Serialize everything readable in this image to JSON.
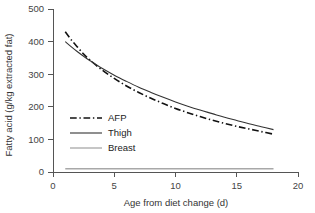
{
  "chart_data": {
    "type": "line",
    "title": "",
    "xlabel": "Age from diet change (d)",
    "ylabel": "Fatty acid (g/kg extracted fat)",
    "xlim": [
      0,
      20
    ],
    "ylim": [
      0,
      500
    ],
    "xticks": [
      0,
      5,
      10,
      15,
      20
    ],
    "yticks": [
      0,
      100,
      200,
      300,
      400,
      500
    ],
    "xtick_labels": [
      "0",
      "5",
      "10",
      "15",
      "20"
    ],
    "ytick_labels": [
      "0",
      "100",
      "200",
      "300",
      "400",
      "500"
    ],
    "grid": false,
    "legend_position": "center-left",
    "series": [
      {
        "name": "AFP",
        "style": "dash-dot",
        "color": "#111111",
        "width": 1.6,
        "x": [
          1,
          1.5,
          2,
          2.5,
          3,
          4,
          5,
          6,
          7,
          8,
          9,
          10,
          11,
          12,
          13,
          14,
          15,
          16,
          17,
          18
        ],
        "y": [
          430,
          405,
          383,
          362,
          344,
          313,
          287,
          264,
          244,
          226,
          210,
          195,
          182,
          170,
          159,
          149,
          140,
          132,
          124,
          116
        ]
      },
      {
        "name": "Thigh",
        "style": "solid",
        "color": "#333333",
        "width": 1.1,
        "x": [
          1,
          1.5,
          2,
          2.5,
          3,
          4,
          5,
          6,
          7,
          8,
          9,
          10,
          11,
          12,
          13,
          14,
          15,
          16,
          17,
          18
        ],
        "y": [
          400,
          384,
          369,
          355,
          342,
          318,
          297,
          278,
          260,
          244,
          229,
          215,
          202,
          190,
          179,
          168,
          158,
          148,
          139,
          130
        ]
      },
      {
        "name": "Breast",
        "style": "solid",
        "color": "#a8a8a8",
        "width": 1.3,
        "x": [
          1,
          18
        ],
        "y": [
          10,
          10
        ]
      }
    ]
  },
  "legend": {
    "items": [
      {
        "label": "AFP"
      },
      {
        "label": "Thigh"
      },
      {
        "label": "Breast"
      }
    ]
  }
}
